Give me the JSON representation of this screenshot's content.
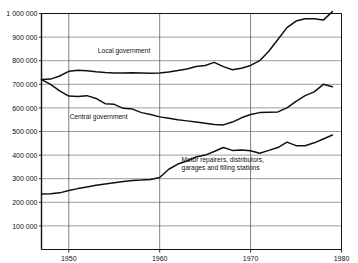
{
  "chart_data": {
    "type": "line",
    "title": "",
    "subtitle": "",
    "xlabel": "",
    "ylabel": "",
    "xlim": [
      1947,
      1980
    ],
    "ylim": [
      0,
      1000000
    ],
    "grid": true,
    "legend_position": "inline-annotations",
    "y_ticks": [
      100000,
      200000,
      300000,
      400000,
      500000,
      600000,
      700000,
      800000,
      900000,
      1000000
    ],
    "y_tick_labels": [
      "100 000",
      "200 000",
      "300 000",
      "400 000",
      "500 000",
      "600 000",
      "700 000",
      "800 000",
      "900 000",
      "1 000 000"
    ],
    "x_ticks": [
      1950,
      1960,
      1970,
      1980
    ],
    "x_tick_labels": [
      "1950",
      "1960",
      "1970",
      "1980"
    ],
    "series": [
      {
        "name": "Local government",
        "label": "Local government",
        "label_x": 1953.2,
        "label_y": 832000,
        "color": "#111111",
        "x": [
          1947,
          1948,
          1949,
          1950,
          1951,
          1952,
          1953,
          1954,
          1955,
          1956,
          1957,
          1958,
          1959,
          1960,
          1961,
          1962,
          1963,
          1964,
          1965,
          1966,
          1967,
          1968,
          1969,
          1970,
          1971,
          1972,
          1973,
          1974,
          1975,
          1976,
          1977,
          1978,
          1979
        ],
        "values": [
          720000,
          722000,
          735000,
          755000,
          760000,
          757000,
          753000,
          750000,
          748000,
          748000,
          749000,
          748000,
          747000,
          748000,
          752000,
          758000,
          765000,
          775000,
          780000,
          793000,
          775000,
          762000,
          768000,
          780000,
          800000,
          840000,
          890000,
          940000,
          968000,
          978000,
          978000,
          972000,
          1008000
        ]
      },
      {
        "name": "Central government",
        "label": "Central government",
        "label_x": 1950.1,
        "label_y": 552000,
        "color": "#111111",
        "x": [
          1947,
          1948,
          1949,
          1950,
          1951,
          1952,
          1953,
          1954,
          1955,
          1956,
          1957,
          1958,
          1959,
          1960,
          1961,
          1962,
          1963,
          1964,
          1965,
          1966,
          1967,
          1968,
          1969,
          1970,
          1971,
          1972,
          1973,
          1974,
          1975,
          1976,
          1977,
          1978,
          1979
        ],
        "values": [
          720000,
          700000,
          672000,
          650000,
          648000,
          652000,
          640000,
          618000,
          615000,
          598000,
          595000,
          580000,
          572000,
          562000,
          556000,
          550000,
          545000,
          540000,
          535000,
          530000,
          528000,
          540000,
          558000,
          572000,
          580000,
          582000,
          583000,
          600000,
          628000,
          652000,
          668000,
          700000,
          690000
        ]
      },
      {
        "name": "Motor repairers, distributors, garages and filling stations",
        "label": "Motor repairers, distributors,\ngarages and filling stations",
        "label_line1": "Motor repairers, distributors,",
        "label_line2": "garages and filling stations",
        "label_x": 1962.4,
        "label_y": 372000,
        "color": "#111111",
        "x": [
          1947,
          1948,
          1949,
          1950,
          1951,
          1952,
          1953,
          1954,
          1955,
          1956,
          1957,
          1958,
          1959,
          1960,
          1961,
          1962,
          1963,
          1964,
          1965,
          1966,
          1967,
          1968,
          1969,
          1970,
          1971,
          1972,
          1973,
          1974,
          1975,
          1976,
          1977,
          1978,
          1979
        ],
        "values": [
          235000,
          236000,
          240000,
          250000,
          258000,
          265000,
          272000,
          278000,
          283000,
          288000,
          292000,
          294000,
          297000,
          305000,
          340000,
          362000,
          375000,
          392000,
          400000,
          415000,
          432000,
          420000,
          422000,
          418000,
          408000,
          420000,
          432000,
          455000,
          440000,
          440000,
          452000,
          468000,
          485000
        ]
      }
    ]
  },
  "axes": {
    "y_label_unit": "",
    "x_label_unit": ""
  }
}
